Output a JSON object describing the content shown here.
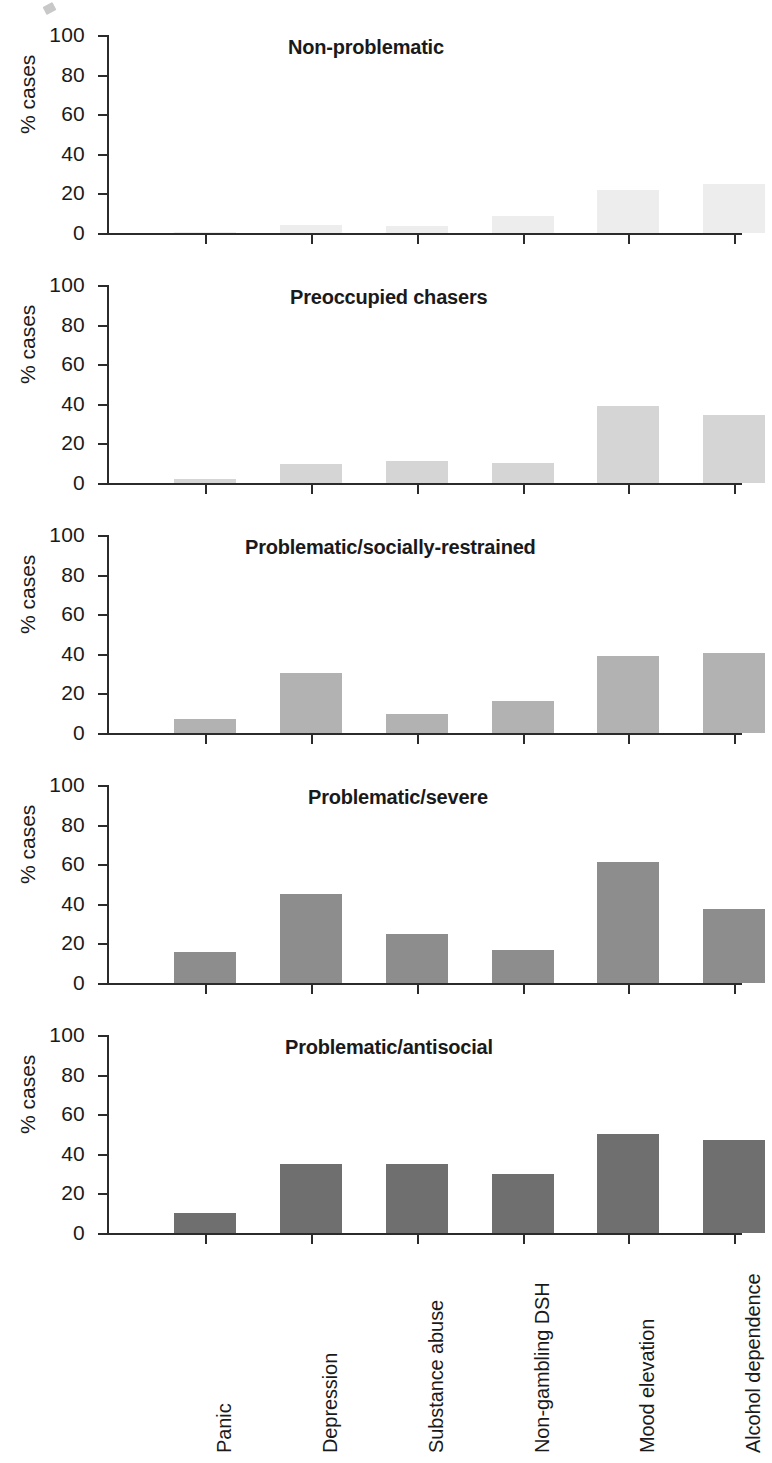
{
  "chart_data": {
    "type": "bar",
    "title": "",
    "xlabel": "",
    "ylabel": "% cases",
    "ylim": [
      0,
      100
    ],
    "ytick_labels": [
      "100",
      "80",
      "60",
      "40",
      "20",
      "0"
    ],
    "yticks": [
      100,
      80,
      60,
      40,
      20,
      0
    ],
    "grid": false,
    "legend": "none",
    "categories": [
      "Panic",
      "Depression",
      "Substance abuse",
      "Non-gambling DSH",
      "Mood elevation",
      "Alcohol dependence"
    ],
    "panels": [
      {
        "title": "Non-problematic",
        "color": "#ededed",
        "values": [
          0.5,
          4,
          3.5,
          8.5,
          21.5,
          25
        ]
      },
      {
        "title": "Preoccupied chasers",
        "color": "#d5d5d5",
        "values": [
          2,
          9.5,
          11,
          10,
          39,
          34.5
        ]
      },
      {
        "title": "Problematic/socially-restrained",
        "color": "#b2b2b2",
        "values": [
          7,
          30.5,
          9.5,
          16,
          39,
          40.5
        ]
      },
      {
        "title": "Problematic/severe",
        "color": "#8d8d8d",
        "values": [
          15.5,
          45,
          25,
          16.5,
          61,
          37.5
        ]
      },
      {
        "title": "Problematic/antisocial",
        "color": "#6f6f6f",
        "values": [
          10,
          35,
          35,
          30,
          50,
          47
        ]
      }
    ]
  },
  "axis": {
    "ylabel": "% cases"
  }
}
